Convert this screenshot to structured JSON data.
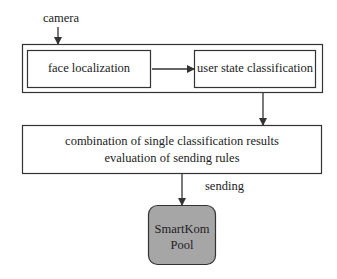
{
  "diagram": {
    "input_label": "camera",
    "nodes": {
      "face_localization": "face localization",
      "user_state_classification": "user state classification",
      "combination_line1": "combination of single classification results",
      "combination_line2": "evaluation of sending rules",
      "pool_line1": "SmartKom",
      "pool_line2": "Pool"
    },
    "edge_labels": {
      "sending": "sending"
    },
    "colors": {
      "line": "#333333",
      "pool_fill": "#a6a6a6",
      "background": "#ffffff"
    }
  }
}
